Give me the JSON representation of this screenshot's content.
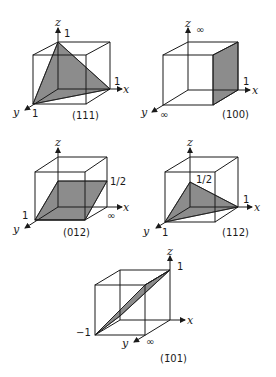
{
  "figure": {
    "plane_fill": "#8c8c8c",
    "line_color": "#1a1a1a",
    "panels": [
      {
        "id": "p111",
        "miller_label": "(111)",
        "axis_labels": {
          "x": "x",
          "y": "y",
          "z": "z"
        },
        "intercepts": {
          "x": "1",
          "y": "1",
          "z": "1"
        }
      },
      {
        "id": "p100",
        "miller_label": "(100)",
        "axis_labels": {
          "x": "x",
          "y": "y",
          "z": "z"
        },
        "intercepts": {
          "x": "1",
          "y": "∞",
          "z": "∞"
        }
      },
      {
        "id": "p012",
        "miller_label": "(012)",
        "axis_labels": {
          "x": "x",
          "y": "y",
          "z": "z"
        },
        "intercepts": {
          "x": "∞",
          "y": "1",
          "z": "1/2"
        }
      },
      {
        "id": "p112",
        "miller_label": "(112)",
        "axis_labels": {
          "x": "x",
          "y": "y",
          "z": "z"
        },
        "intercepts": {
          "x": "1",
          "y": "1",
          "z": "1/2"
        }
      },
      {
        "id": "p-101",
        "miller_label": "(1̄01)",
        "axis_labels": {
          "x": "x",
          "y": "y",
          "z": "z"
        },
        "intercepts": {
          "x": "−1",
          "y": "∞",
          "z": "1"
        }
      }
    ]
  }
}
